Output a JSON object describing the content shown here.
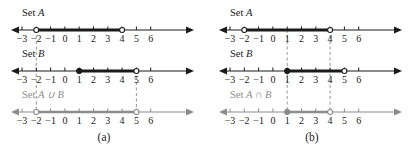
{
  "figure": {
    "panels": [
      {
        "caption": "(a)",
        "operation_symbol": "∪",
        "lines": [
          {
            "label_prefix": "Set",
            "label_set": "A",
            "label_full": "Set A",
            "color": "#1a1a1a",
            "interval": {
              "start": -2,
              "end": 4,
              "start_closed": false,
              "end_closed": false
            },
            "ticks": [
              -3,
              -2,
              -1,
              0,
              1,
              2,
              3,
              4,
              5,
              6
            ],
            "tick_labels": [
              "−3",
              "−2",
              "−1",
              "0",
              "1",
              "2",
              "3",
              "4",
              "5",
              "6"
            ]
          },
          {
            "label_prefix": "Set",
            "label_set": "B",
            "label_full": "Set B",
            "color": "#1a1a1a",
            "interval": {
              "start": 1,
              "end": 5,
              "start_closed": true,
              "end_closed": false
            },
            "ticks": [
              -3,
              -2,
              -1,
              0,
              1,
              2,
              3,
              4,
              5,
              6
            ],
            "tick_labels": [
              "−3",
              "−2",
              "−1",
              "0",
              "1",
              "2",
              "3",
              "4",
              "5",
              "6"
            ]
          },
          {
            "label_prefix": "Set",
            "label_set": "A ∪ B",
            "label_full": "Set A ∪ B",
            "color": "#8c8c8c",
            "interval": {
              "start": -2,
              "end": 5,
              "start_closed": false,
              "end_closed": false
            },
            "ticks": [
              -3,
              -2,
              -1,
              0,
              1,
              2,
              3,
              4,
              5,
              6
            ],
            "tick_labels": [
              "−3",
              "−2",
              "−1",
              "0",
              "1",
              "2",
              "3",
              "4",
              "5",
              "6"
            ]
          }
        ],
        "guides": [
          {
            "value": -2,
            "from_row": 0,
            "to_row": 2
          },
          {
            "value": 5,
            "from_row": 1,
            "to_row": 2
          }
        ]
      },
      {
        "caption": "(b)",
        "operation_symbol": "∩",
        "lines": [
          {
            "label_prefix": "Set",
            "label_set": "A",
            "label_full": "Set A",
            "color": "#1a1a1a",
            "interval": {
              "start": -2,
              "end": 4,
              "start_closed": false,
              "end_closed": false
            },
            "ticks": [
              -3,
              -2,
              -1,
              0,
              1,
              2,
              3,
              4,
              5,
              6
            ],
            "tick_labels": [
              "−3",
              "−2",
              "−1",
              "0",
              "1",
              "2",
              "3",
              "4",
              "5",
              "6"
            ]
          },
          {
            "label_prefix": "Set",
            "label_set": "B",
            "label_full": "Set B",
            "color": "#1a1a1a",
            "interval": {
              "start": 1,
              "end": 5,
              "start_closed": true,
              "end_closed": false
            },
            "ticks": [
              -3,
              -2,
              -1,
              0,
              1,
              2,
              3,
              4,
              5,
              6
            ],
            "tick_labels": [
              "−3",
              "−2",
              "−1",
              "0",
              "1",
              "2",
              "3",
              "4",
              "5",
              "6"
            ]
          },
          {
            "label_prefix": "Set",
            "label_set": "A ∩ B",
            "label_full": "Set A ∩ B",
            "color": "#8c8c8c",
            "interval": {
              "start": 1,
              "end": 4,
              "start_closed": true,
              "end_closed": false
            },
            "ticks": [
              -3,
              -2,
              -1,
              0,
              1,
              2,
              3,
              4,
              5,
              6
            ],
            "tick_labels": [
              "−3",
              "−2",
              "−1",
              "0",
              "1",
              "2",
              "3",
              "4",
              "5",
              "6"
            ]
          }
        ],
        "guides": [
          {
            "value": 1,
            "from_row": 0,
            "to_row": 2
          },
          {
            "value": 4,
            "from_row": 0,
            "to_row": 2
          }
        ]
      }
    ],
    "colors": {
      "axis": "#1a1a1a",
      "highlight": "#000000",
      "muted": "#8c8c8c",
      "guide": "#8c8c8c",
      "background": "#ffffff"
    }
  }
}
